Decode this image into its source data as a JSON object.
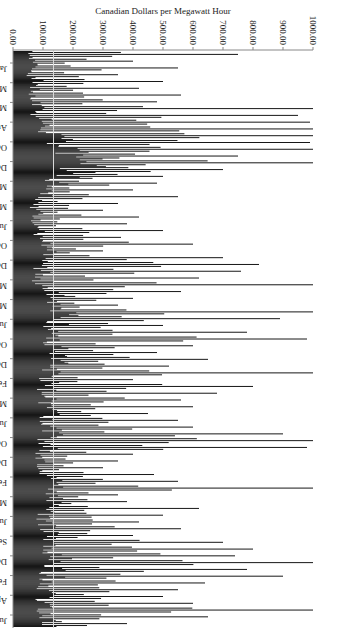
{
  "chart_data": {
    "type": "bar",
    "title": "",
    "xlabel": "",
    "ylabel": "Canadian Dollars per Megawatt Hour",
    "ylim": [
      0,
      1000
    ],
    "yticks": [
      "0.00",
      "100.00",
      "200.00",
      "300.00",
      "400.00",
      "500.00",
      "600.00",
      "700.00",
      "800.00",
      "900.00",
      "1000.00"
    ],
    "reference_line": 135,
    "xtick_labels": [
      "Jan 02/00",
      "Mar 14/00",
      "May 25/00",
      "Aug 05/00",
      "Oct 16/00",
      "Dec 27/00",
      "Mar 09/01",
      "May 20/01",
      "Jul 31/01",
      "Oct 11/01",
      "Dec 22/01",
      "Mar 04/02",
      "May 15/02",
      "Jul 26/02",
      "Oct 06/02",
      "Dec 17/02",
      "Feb 27/03",
      "May 10/03",
      "Jul 21/03",
      "Oct 01/03",
      "Dec 12/03",
      "Feb 22/04",
      "May 04/04",
      "Jul 15/04",
      "Sep 25/04",
      "Dec 06/04",
      "Feb 16/05",
      "Apr 29/05",
      "Jul 10/05"
    ],
    "series": [
      {
        "name": "Hourly price (sampled peaks)",
        "base_values": [
          45,
          50,
          55,
          40,
          60,
          50,
          45,
          55,
          70,
          60,
          80,
          90,
          110,
          150,
          170,
          200,
          210,
          220,
          160,
          130,
          110,
          90,
          70,
          60,
          55,
          60,
          65,
          70,
          80,
          90,
          85,
          80,
          75,
          70,
          85,
          100,
          120,
          140,
          160,
          150,
          130,
          110,
          100,
          120,
          140,
          130,
          120,
          110,
          100,
          90,
          95,
          100,
          110,
          120,
          115,
          110,
          105,
          100,
          95,
          90,
          85,
          90,
          100,
          110,
          120,
          130,
          120,
          110,
          100,
          95,
          90,
          100,
          110,
          120,
          130,
          125,
          120,
          110,
          100,
          95,
          90,
          85,
          80,
          85,
          90
        ],
        "peak_values": [
          750,
          400,
          550,
          350,
          500,
          420,
          560,
          480,
          1000,
          950,
          990,
          1000,
          1000,
          990,
          1000,
          750,
          1000,
          700,
          500,
          480,
          400,
          550,
          350,
          300,
          420,
          380,
          500,
          360,
          600,
          300,
          700,
          820,
          760,
          620,
          1000,
          560,
          400,
          350,
          1000,
          890,
          500,
          780,
          980,
          600,
          480,
          650,
          520,
          1000,
          400,
          800,
          680,
          560,
          600,
          450,
          550,
          600,
          900,
          1000,
          980,
          400,
          350,
          300,
          470,
          550,
          1000,
          350,
          380,
          620,
          500,
          420,
          560,
          400,
          700,
          800,
          740,
          1000,
          780,
          900,
          640,
          550,
          500,
          600,
          1000,
          650,
          380
        ]
      }
    ]
  }
}
